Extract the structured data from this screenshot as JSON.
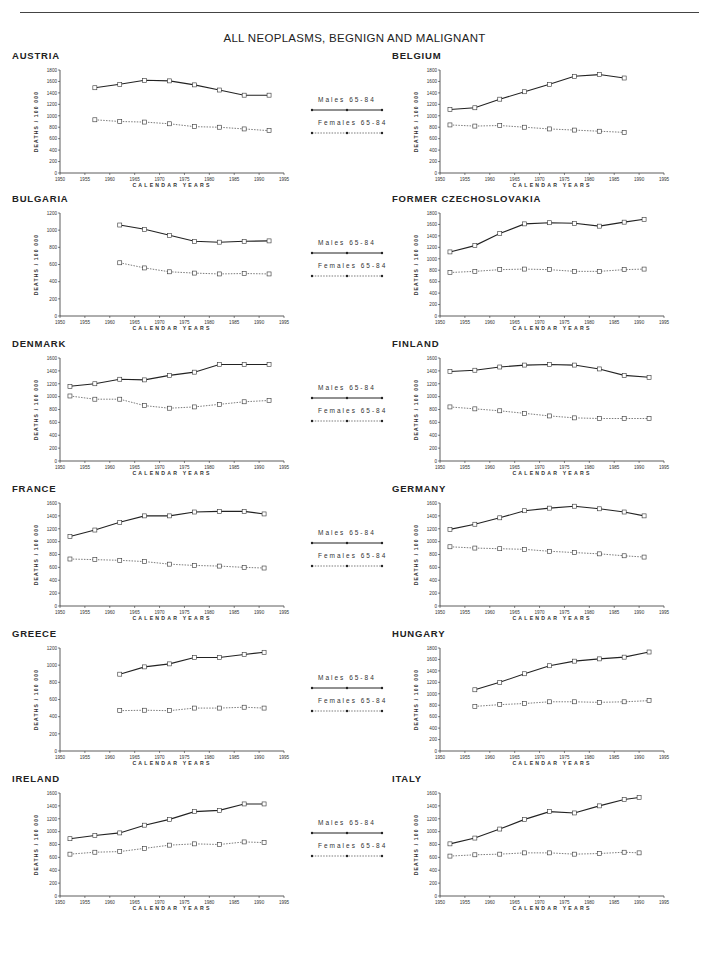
{
  "page": {
    "title": "ALL NEOPLASMS, BEGNIGN AND MALIGNANT",
    "legend": {
      "males": "Males 65-84",
      "females": "Females 65-84"
    },
    "xlabel": "CALENDAR YEARS",
    "ylabel": "DEATHS / 100 000"
  },
  "chart_data": [
    {
      "type": "line",
      "title": "AUSTRIA",
      "xlabel": "CALENDAR YEARS",
      "ylabel": "DEATHS / 100 000",
      "xlim": [
        1950,
        1995
      ],
      "ylim": [
        0,
        1800
      ],
      "yticks": [
        0,
        200,
        400,
        600,
        800,
        1000,
        1200,
        1400,
        1600,
        1800
      ],
      "x": [
        1957,
        1962,
        1967,
        1972,
        1977,
        1982,
        1987,
        1992
      ],
      "series": [
        {
          "name": "Males 65-84",
          "values": [
            1490,
            1550,
            1620,
            1610,
            1540,
            1450,
            1360,
            1360
          ]
        },
        {
          "name": "Females 65-84",
          "values": [
            930,
            900,
            890,
            860,
            810,
            800,
            770,
            740
          ]
        }
      ]
    },
    {
      "type": "line",
      "title": "BELGIUM",
      "xlabel": "CALENDAR YEARS",
      "ylabel": "DEATHS / 100 000",
      "xlim": [
        1950,
        1995
      ],
      "ylim": [
        0,
        1800
      ],
      "yticks": [
        0,
        200,
        400,
        600,
        800,
        1000,
        1200,
        1400,
        1600,
        1800
      ],
      "x": [
        1952,
        1957,
        1962,
        1967,
        1972,
        1977,
        1982,
        1987
      ],
      "series": [
        {
          "name": "Males 65-84",
          "values": [
            1110,
            1140,
            1290,
            1420,
            1550,
            1690,
            1720,
            1660
          ]
        },
        {
          "name": "Females 65-84",
          "values": [
            840,
            820,
            830,
            800,
            770,
            750,
            730,
            710
          ]
        }
      ]
    },
    {
      "type": "line",
      "title": "BULGARIA",
      "xlabel": "CALENDAR YEARS",
      "ylabel": "DEATHS / 100 000",
      "xlim": [
        1950,
        1995
      ],
      "ylim": [
        0,
        1200
      ],
      "yticks": [
        0,
        200,
        400,
        600,
        800,
        1000,
        1200
      ],
      "x": [
        1962,
        1967,
        1972,
        1977,
        1982,
        1987,
        1992
      ],
      "series": [
        {
          "name": "Males 65-84",
          "values": [
            1060,
            1010,
            940,
            870,
            860,
            870,
            875
          ]
        },
        {
          "name": "Females 65-84",
          "values": [
            620,
            560,
            515,
            500,
            490,
            495,
            490
          ]
        }
      ]
    },
    {
      "type": "line",
      "title": "FORMER CZECHOSLOVAKIA",
      "xlabel": "CALENDAR YEARS",
      "ylabel": "DEATHS / 100 000",
      "xlim": [
        1950,
        1995
      ],
      "ylim": [
        0,
        1800
      ],
      "yticks": [
        0,
        200,
        400,
        600,
        800,
        1000,
        1200,
        1400,
        1600,
        1800
      ],
      "x": [
        1952,
        1957,
        1962,
        1967,
        1972,
        1977,
        1982,
        1987,
        1991
      ],
      "series": [
        {
          "name": "Males 65-84",
          "values": [
            1120,
            1230,
            1440,
            1610,
            1630,
            1620,
            1570,
            1640,
            1690
          ]
        },
        {
          "name": "Females 65-84",
          "values": [
            760,
            780,
            810,
            820,
            810,
            780,
            780,
            810,
            820
          ]
        }
      ]
    },
    {
      "type": "line",
      "title": "DENMARK",
      "xlabel": "CALENDAR YEARS",
      "ylabel": "DEATHS / 100 000",
      "xlim": [
        1950,
        1995
      ],
      "ylim": [
        0,
        1600
      ],
      "yticks": [
        0,
        200,
        400,
        600,
        800,
        1000,
        1200,
        1400,
        1600
      ],
      "x": [
        1952,
        1957,
        1962,
        1967,
        1972,
        1977,
        1982,
        1987,
        1992
      ],
      "series": [
        {
          "name": "Males 65-84",
          "values": [
            1160,
            1200,
            1270,
            1260,
            1330,
            1380,
            1500,
            1500,
            1500
          ]
        },
        {
          "name": "Females 65-84",
          "values": [
            1010,
            960,
            960,
            860,
            820,
            840,
            880,
            920,
            940
          ]
        }
      ]
    },
    {
      "type": "line",
      "title": "FINLAND",
      "xlabel": "CALENDAR YEARS",
      "ylabel": "DEATHS / 100 000",
      "xlim": [
        1950,
        1995
      ],
      "ylim": [
        0,
        1600
      ],
      "yticks": [
        0,
        200,
        400,
        600,
        800,
        1000,
        1200,
        1400,
        1600
      ],
      "x": [
        1952,
        1957,
        1962,
        1967,
        1972,
        1977,
        1982,
        1987,
        1992
      ],
      "series": [
        {
          "name": "Males 65-84",
          "values": [
            1390,
            1410,
            1460,
            1490,
            1500,
            1490,
            1430,
            1330,
            1300
          ]
        },
        {
          "name": "Females 65-84",
          "values": [
            840,
            810,
            780,
            740,
            700,
            670,
            660,
            660,
            660
          ]
        }
      ]
    },
    {
      "type": "line",
      "title": "FRANCE",
      "xlabel": "CALENDAR YEARS",
      "ylabel": "DEATHS / 100 000",
      "xlim": [
        1950,
        1995
      ],
      "ylim": [
        0,
        1600
      ],
      "yticks": [
        0,
        200,
        400,
        600,
        800,
        1000,
        1200,
        1400,
        1600
      ],
      "x": [
        1952,
        1957,
        1962,
        1967,
        1972,
        1977,
        1982,
        1987,
        1991
      ],
      "series": [
        {
          "name": "Males 65-84",
          "values": [
            1080,
            1180,
            1300,
            1400,
            1400,
            1460,
            1470,
            1470,
            1430
          ]
        },
        {
          "name": "Females 65-84",
          "values": [
            730,
            720,
            710,
            690,
            650,
            630,
            620,
            600,
            590
          ]
        }
      ]
    },
    {
      "type": "line",
      "title": "GERMANY",
      "xlabel": "CALENDAR YEARS",
      "ylabel": "DEATHS / 100 000",
      "xlim": [
        1950,
        1995
      ],
      "ylim": [
        0,
        1600
      ],
      "yticks": [
        0,
        200,
        400,
        600,
        800,
        1000,
        1200,
        1400,
        1600
      ],
      "x": [
        1952,
        1957,
        1962,
        1967,
        1972,
        1977,
        1982,
        1987,
        1991
      ],
      "series": [
        {
          "name": "Males 65-84",
          "values": [
            1190,
            1270,
            1370,
            1480,
            1520,
            1550,
            1510,
            1460,
            1400
          ]
        },
        {
          "name": "Females 65-84",
          "values": [
            920,
            900,
            890,
            880,
            850,
            830,
            810,
            780,
            760
          ]
        }
      ]
    },
    {
      "type": "line",
      "title": "GREECE",
      "xlabel": "CALENDAR YEARS",
      "ylabel": "DEATHS / 100 000",
      "xlim": [
        1950,
        1995
      ],
      "ylim": [
        0,
        1200
      ],
      "yticks": [
        0,
        200,
        400,
        600,
        800,
        1000,
        1200
      ],
      "x": [
        1962,
        1967,
        1972,
        1977,
        1982,
        1987,
        1991
      ],
      "series": [
        {
          "name": "Males 65-84",
          "values": [
            895,
            980,
            1015,
            1090,
            1090,
            1125,
            1150
          ]
        },
        {
          "name": "Females 65-84",
          "values": [
            470,
            475,
            470,
            500,
            500,
            510,
            500
          ]
        }
      ]
    },
    {
      "type": "line",
      "title": "HUNGARY",
      "xlabel": "CALENDAR YEARS",
      "ylabel": "DEATHS / 100 000",
      "xlim": [
        1950,
        1995
      ],
      "ylim": [
        0,
        1800
      ],
      "yticks": [
        0,
        200,
        400,
        600,
        800,
        1000,
        1200,
        1400,
        1600,
        1800
      ],
      "x": [
        1957,
        1962,
        1967,
        1972,
        1977,
        1982,
        1987,
        1992
      ],
      "series": [
        {
          "name": "Males 65-84",
          "values": [
            1070,
            1200,
            1350,
            1490,
            1570,
            1610,
            1640,
            1730
          ]
        },
        {
          "name": "Females 65-84",
          "values": [
            780,
            810,
            830,
            860,
            860,
            850,
            860,
            880
          ]
        }
      ]
    },
    {
      "type": "line",
      "title": "IRELAND",
      "xlabel": "CALENDAR YEARS",
      "ylabel": "DEATHS / 100 000",
      "xlim": [
        1950,
        1995
      ],
      "ylim": [
        0,
        1600
      ],
      "yticks": [
        0,
        200,
        400,
        600,
        800,
        1000,
        1200,
        1400,
        1600
      ],
      "x": [
        1952,
        1957,
        1962,
        1967,
        1972,
        1977,
        1982,
        1987,
        1991
      ],
      "series": [
        {
          "name": "Males 65-84",
          "values": [
            890,
            940,
            980,
            1100,
            1190,
            1310,
            1330,
            1430,
            1430
          ]
        },
        {
          "name": "Females 65-84",
          "values": [
            650,
            680,
            690,
            740,
            790,
            810,
            800,
            840,
            830
          ]
        }
      ]
    },
    {
      "type": "line",
      "title": "ITALY",
      "xlabel": "CALENDAR YEARS",
      "ylabel": "DEATHS / 100 000",
      "xlim": [
        1950,
        1995
      ],
      "ylim": [
        0,
        1600
      ],
      "yticks": [
        0,
        200,
        400,
        600,
        800,
        1000,
        1200,
        1400,
        1600
      ],
      "x": [
        1952,
        1957,
        1962,
        1967,
        1972,
        1977,
        1982,
        1987,
        1990
      ],
      "series": [
        {
          "name": "Males 65-84",
          "values": [
            810,
            900,
            1040,
            1190,
            1310,
            1290,
            1400,
            1500,
            1530
          ]
        },
        {
          "name": "Females 65-84",
          "values": [
            620,
            640,
            650,
            670,
            670,
            650,
            660,
            680,
            670
          ]
        }
      ]
    }
  ],
  "xticks": [
    1950,
    1955,
    1960,
    1965,
    1970,
    1975,
    1980,
    1985,
    1990,
    1995
  ]
}
